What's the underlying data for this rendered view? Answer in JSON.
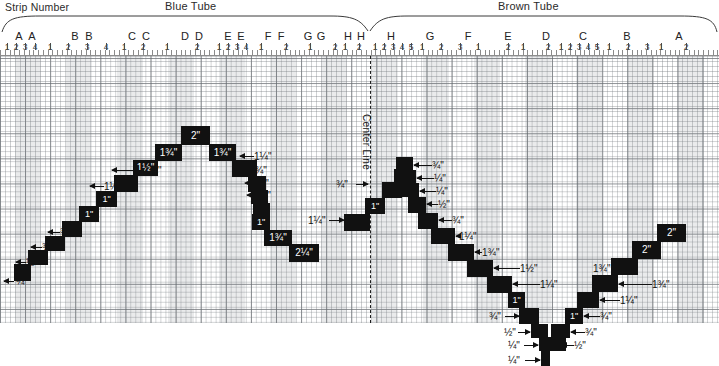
{
  "header": {
    "strip_number_label": "Strip Number",
    "blue_tube_label": "Blue Tube",
    "brown_tube_label": "Brown Tube",
    "center_line_label": "Center Line"
  },
  "ruler": {
    "letters": [
      {
        "label": "A",
        "x": 19
      },
      {
        "label": "A",
        "x": 32
      },
      {
        "label": "B",
        "x": 75
      },
      {
        "label": "B",
        "x": 89
      },
      {
        "label": "C",
        "x": 132
      },
      {
        "label": "C",
        "x": 146
      },
      {
        "label": "D",
        "x": 185
      },
      {
        "label": "D",
        "x": 199
      },
      {
        "label": "E",
        "x": 228
      },
      {
        "label": "E",
        "x": 241
      },
      {
        "label": "F",
        "x": 268
      },
      {
        "label": "F",
        "x": 281
      },
      {
        "label": "G",
        "x": 308
      },
      {
        "label": "G",
        "x": 321
      },
      {
        "label": "H",
        "x": 348
      },
      {
        "label": "H",
        "x": 361
      },
      {
        "label": "H",
        "x": 391
      },
      {
        "label": "G",
        "x": 430
      },
      {
        "label": "F",
        "x": 468
      },
      {
        "label": "E",
        "x": 508
      },
      {
        "label": "D",
        "x": 546
      },
      {
        "label": "C",
        "x": 583
      },
      {
        "label": "B",
        "x": 627
      },
      {
        "label": "A",
        "x": 679
      }
    ],
    "numbers": [
      {
        "label": "1",
        "x": 7
      },
      {
        "label": "2",
        "x": 16
      },
      {
        "label": "3",
        "x": 25
      },
      {
        "label": "4",
        "x": 35
      },
      {
        "label": "1",
        "x": 50
      },
      {
        "label": "2",
        "x": 68
      },
      {
        "label": "3",
        "x": 87
      },
      {
        "label": "4",
        "x": 106
      },
      {
        "label": "1",
        "x": 124
      },
      {
        "label": "2",
        "x": 143
      },
      {
        "label": "1",
        "x": 167
      },
      {
        "label": "2",
        "x": 197
      },
      {
        "label": "1",
        "x": 219
      },
      {
        "label": "2",
        "x": 228
      },
      {
        "label": "3",
        "x": 237
      },
      {
        "label": "4",
        "x": 246
      },
      {
        "label": "1",
        "x": 261
      },
      {
        "label": "2",
        "x": 286
      },
      {
        "label": "1",
        "x": 310
      },
      {
        "label": "2",
        "x": 335
      },
      {
        "label": "1",
        "x": 345
      },
      {
        "label": "2",
        "x": 359
      },
      {
        "label": "1",
        "x": 375
      },
      {
        "label": "2",
        "x": 384
      },
      {
        "label": "3",
        "x": 393
      },
      {
        "label": "4",
        "x": 402
      },
      {
        "label": "5",
        "x": 411
      },
      {
        "label": "1",
        "x": 422
      },
      {
        "label": "2",
        "x": 441
      },
      {
        "label": "3",
        "x": 460
      },
      {
        "label": "1",
        "x": 478
      },
      {
        "label": "2",
        "x": 508
      },
      {
        "label": "1",
        "x": 523
      },
      {
        "label": "2",
        "x": 548
      },
      {
        "label": "1",
        "x": 561
      },
      {
        "label": "2",
        "x": 570
      },
      {
        "label": "3",
        "x": 579
      },
      {
        "label": "4",
        "x": 588
      },
      {
        "label": "5",
        "x": 597
      },
      {
        "label": "1",
        "x": 609
      },
      {
        "label": "2",
        "x": 628
      },
      {
        "label": "3",
        "x": 647
      },
      {
        "label": "1",
        "x": 661
      },
      {
        "label": "2",
        "x": 686
      }
    ]
  },
  "shading_bands": [
    {
      "x": 15,
      "w": 26
    },
    {
      "x": 66,
      "w": 26
    },
    {
      "x": 117,
      "w": 26
    },
    {
      "x": 168,
      "w": 26
    },
    {
      "x": 219,
      "w": 26
    },
    {
      "x": 270,
      "w": 26
    },
    {
      "x": 321,
      "w": 26
    },
    {
      "x": 372,
      "w": 26
    },
    {
      "x": 423,
      "w": 26
    },
    {
      "x": 474,
      "w": 26
    },
    {
      "x": 525,
      "w": 26
    },
    {
      "x": 576,
      "w": 26
    },
    {
      "x": 627,
      "w": 26
    },
    {
      "x": 678,
      "w": 26
    }
  ],
  "blocks": [
    {
      "id": "b1",
      "x": 14,
      "y": 208,
      "w": 17,
      "h": 17,
      "label": ""
    },
    {
      "id": "b2",
      "x": 28,
      "y": 194,
      "w": 20,
      "h": 15,
      "label": ""
    },
    {
      "id": "b3",
      "x": 45,
      "y": 180,
      "w": 20,
      "h": 15,
      "label": ""
    },
    {
      "id": "b4",
      "x": 62,
      "y": 165,
      "w": 20,
      "h": 16,
      "label": ""
    },
    {
      "id": "b5",
      "x": 79,
      "y": 150,
      "w": 20,
      "h": 16,
      "label": "1\""
    },
    {
      "id": "b6",
      "x": 96,
      "y": 135,
      "w": 21,
      "h": 16,
      "label": "1\""
    },
    {
      "id": "b7",
      "x": 114,
      "y": 119,
      "w": 24,
      "h": 17,
      "label": ""
    },
    {
      "id": "b8",
      "x": 133,
      "y": 104,
      "w": 25,
      "h": 16,
      "label": "1½\""
    },
    {
      "id": "b9",
      "x": 155,
      "y": 88,
      "w": 27,
      "h": 17,
      "label": "1¾\""
    },
    {
      "id": "b10",
      "x": 181,
      "y": 70,
      "w": 29,
      "h": 19,
      "label": "2\""
    },
    {
      "id": "b11",
      "x": 209,
      "y": 88,
      "w": 27,
      "h": 17,
      "label": "1¾\""
    },
    {
      "id": "b12",
      "x": 232,
      "y": 104,
      "w": 25,
      "h": 17,
      "label": ""
    },
    {
      "id": "b13",
      "x": 248,
      "y": 120,
      "w": 18,
      "h": 16,
      "label": ""
    },
    {
      "id": "b14",
      "x": 251,
      "y": 134,
      "w": 17,
      "h": 14,
      "label": ""
    },
    {
      "id": "b15",
      "x": 253,
      "y": 147,
      "w": 17,
      "h": 14,
      "label": ""
    },
    {
      "id": "b16",
      "x": 252,
      "y": 158,
      "w": 18,
      "h": 16,
      "label": "1\""
    },
    {
      "id": "b17",
      "x": 264,
      "y": 174,
      "w": 28,
      "h": 16,
      "label": "1¾\""
    },
    {
      "id": "b18",
      "x": 289,
      "y": 188,
      "w": 30,
      "h": 18,
      "label": "2¼\""
    },
    {
      "id": "b19",
      "x": 344,
      "y": 158,
      "w": 26,
      "h": 17,
      "label": ""
    },
    {
      "id": "b20",
      "x": 365,
      "y": 142,
      "w": 20,
      "h": 16,
      "label": "1\""
    },
    {
      "id": "b21",
      "x": 382,
      "y": 126,
      "w": 20,
      "h": 16,
      "label": ""
    },
    {
      "id": "b22",
      "x": 394,
      "y": 113,
      "w": 17,
      "h": 14,
      "label": ""
    },
    {
      "id": "b23",
      "x": 396,
      "y": 101,
      "w": 17,
      "h": 14,
      "label": ""
    },
    {
      "id": "b24",
      "x": 399,
      "y": 114,
      "w": 17,
      "h": 14,
      "label": ""
    },
    {
      "id": "b25",
      "x": 402,
      "y": 127,
      "w": 17,
      "h": 14,
      "label": ""
    },
    {
      "id": "b26",
      "x": 408,
      "y": 141,
      "w": 18,
      "h": 16,
      "label": ""
    },
    {
      "id": "b27",
      "x": 418,
      "y": 157,
      "w": 20,
      "h": 16,
      "label": ""
    },
    {
      "id": "b28",
      "x": 431,
      "y": 172,
      "w": 24,
      "h": 16,
      "label": ""
    },
    {
      "id": "b29",
      "x": 448,
      "y": 188,
      "w": 26,
      "h": 17,
      "label": ""
    },
    {
      "id": "b30",
      "x": 467,
      "y": 204,
      "w": 26,
      "h": 17,
      "label": ""
    },
    {
      "id": "b31",
      "x": 487,
      "y": 220,
      "w": 25,
      "h": 17,
      "label": ""
    },
    {
      "id": "b32",
      "x": 508,
      "y": 236,
      "w": 17,
      "h": 16,
      "label": "1\""
    },
    {
      "id": "b33",
      "x": 519,
      "y": 252,
      "w": 20,
      "h": 16,
      "label": ""
    },
    {
      "id": "b34",
      "x": 531,
      "y": 268,
      "w": 17,
      "h": 14,
      "label": ""
    },
    {
      "id": "b35",
      "x": 539,
      "y": 281,
      "w": 12,
      "h": 14,
      "label": ""
    },
    {
      "id": "b36",
      "x": 541,
      "y": 294,
      "w": 9,
      "h": 16,
      "label": ""
    },
    {
      "id": "b37",
      "x": 549,
      "y": 281,
      "w": 17,
      "h": 14,
      "label": ""
    },
    {
      "id": "b38",
      "x": 551,
      "y": 268,
      "w": 19,
      "h": 14,
      "label": ""
    },
    {
      "id": "b39",
      "x": 565,
      "y": 252,
      "w": 18,
      "h": 16,
      "label": "1\""
    },
    {
      "id": "b40",
      "x": 577,
      "y": 236,
      "w": 22,
      "h": 16,
      "label": ""
    },
    {
      "id": "b41",
      "x": 592,
      "y": 219,
      "w": 26,
      "h": 17,
      "label": ""
    },
    {
      "id": "b42",
      "x": 611,
      "y": 202,
      "w": 27,
      "h": 17,
      "label": ""
    },
    {
      "id": "b43",
      "x": 632,
      "y": 185,
      "w": 29,
      "h": 18,
      "label": "2\""
    },
    {
      "id": "b44",
      "x": 657,
      "y": 168,
      "w": 29,
      "h": 18,
      "label": "2\""
    }
  ],
  "callouts": [
    {
      "id": "c1",
      "text": "¼\"",
      "tx": 16,
      "ty": 221,
      "ax": 4,
      "ay": 225,
      "aw": 10,
      "dir": "l"
    },
    {
      "id": "c2",
      "text": "½\"",
      "tx": 26,
      "ty": 202,
      "ax": 16,
      "ay": 206,
      "aw": 10,
      "dir": "l"
    },
    {
      "id": "c3",
      "text": "¾\"",
      "tx": 42,
      "ty": 187,
      "ax": 31,
      "ay": 191,
      "aw": 11,
      "dir": "l"
    },
    {
      "id": "c4",
      "text": "¾\"",
      "tx": 60,
      "ty": 172,
      "ax": 48,
      "ay": 176,
      "aw": 12,
      "dir": "l"
    },
    {
      "id": "c5",
      "text": "1¼\"",
      "tx": 104,
      "ty": 126,
      "ax": 90,
      "ay": 130,
      "aw": 14,
      "dir": "l"
    },
    {
      "id": "c6",
      "text": "1¼\"",
      "tx": 144,
      "ty": 110,
      "ax": 112,
      "ay": 114,
      "aw": 32,
      "dir": "l"
    },
    {
      "id": "c7",
      "text": "1¼\"",
      "tx": 254,
      "ty": 96,
      "ax": 240,
      "ay": 100,
      "aw": 14,
      "dir": "l"
    },
    {
      "id": "c8",
      "text": "¾\"",
      "tx": 255,
      "ty": 110,
      "ax": 243,
      "ay": 114,
      "aw": 12,
      "dir": "l"
    },
    {
      "id": "c9",
      "text": "¼\"",
      "tx": 257,
      "ty": 123,
      "ax": 245,
      "ay": 127,
      "aw": 12,
      "dir": "l"
    },
    {
      "id": "c10",
      "text": "¼\"",
      "tx": 259,
      "ty": 135,
      "ax": 247,
      "ay": 139,
      "aw": 12,
      "dir": "l"
    },
    {
      "id": "c11",
      "text": "1¼\"",
      "tx": 308,
      "ty": 160,
      "ax": 329,
      "ay": 164,
      "aw": 15,
      "dir": "r"
    },
    {
      "id": "c12",
      "text": "¾\"",
      "tx": 336,
      "ty": 124,
      "ax": 356,
      "ay": 128,
      "aw": 12,
      "dir": "r"
    },
    {
      "id": "c13",
      "text": "¾\"",
      "tx": 432,
      "ty": 105,
      "ax": 414,
      "ay": 109,
      "aw": 18,
      "dir": "l"
    },
    {
      "id": "c14",
      "text": "¼\"",
      "tx": 434,
      "ty": 118,
      "ax": 417,
      "ay": 122,
      "aw": 17,
      "dir": "l"
    },
    {
      "id": "c15",
      "text": "¼\"",
      "tx": 436,
      "ty": 131,
      "ax": 420,
      "ay": 135,
      "aw": 16,
      "dir": "l"
    },
    {
      "id": "c16",
      "text": "½\"",
      "tx": 438,
      "ty": 144,
      "ax": 427,
      "ay": 148,
      "aw": 11,
      "dir": "l"
    },
    {
      "id": "c17",
      "text": "¾\"",
      "tx": 452,
      "ty": 160,
      "ax": 439,
      "ay": 164,
      "aw": 13,
      "dir": "l"
    },
    {
      "id": "c18",
      "text": "1¼\"",
      "tx": 459,
      "ty": 176,
      "ax": 456,
      "ay": 180,
      "aw": 3,
      "dir": "l"
    },
    {
      "id": "c19",
      "text": "1¾\"",
      "tx": 482,
      "ty": 192,
      "ax": 475,
      "ay": 196,
      "aw": 7,
      "dir": "l"
    },
    {
      "id": "c20",
      "text": "1½\"",
      "tx": 520,
      "ty": 208,
      "ax": 494,
      "ay": 212,
      "aw": 26,
      "dir": "l"
    },
    {
      "id": "c21",
      "text": "1¼\"",
      "tx": 540,
      "ty": 224,
      "ax": 513,
      "ay": 228,
      "aw": 27,
      "dir": "l"
    },
    {
      "id": "c22",
      "text": "¾\"",
      "tx": 489,
      "ty": 256,
      "ax": 505,
      "ay": 260,
      "aw": 14,
      "dir": "r"
    },
    {
      "id": "c23",
      "text": "½\"",
      "tx": 504,
      "ty": 272,
      "ax": 518,
      "ay": 276,
      "aw": 12,
      "dir": "r"
    },
    {
      "id": "c24",
      "text": "¼\"",
      "tx": 508,
      "ty": 285,
      "ax": 524,
      "ay": 289,
      "aw": 14,
      "dir": "r"
    },
    {
      "id": "c25",
      "text": "¼\"",
      "tx": 508,
      "ty": 300,
      "ax": 525,
      "ay": 304,
      "aw": 15,
      "dir": "r"
    },
    {
      "id": "c26",
      "text": "½\"",
      "tx": 574,
      "ty": 285,
      "ax": 562,
      "ay": 289,
      "aw": 12,
      "dir": "l"
    },
    {
      "id": "c27",
      "text": "¾\"",
      "tx": 585,
      "ty": 272,
      "ax": 571,
      "ay": 276,
      "aw": 14,
      "dir": "l"
    },
    {
      "id": "c28",
      "text": "¾\"",
      "tx": 600,
      "ty": 256,
      "ax": 584,
      "ay": 260,
      "aw": 16,
      "dir": "l"
    },
    {
      "id": "c29",
      "text": "1¼\"",
      "tx": 620,
      "ty": 240,
      "ax": 600,
      "ay": 244,
      "aw": 20,
      "dir": "l"
    },
    {
      "id": "c30",
      "text": "1¾\"",
      "tx": 652,
      "ty": 224,
      "ax": 619,
      "ay": 228,
      "aw": 33,
      "dir": "l"
    },
    {
      "id": "c31",
      "text": "1¾\"",
      "tx": 593,
      "ty": 208,
      "ax": 619,
      "ay": 212,
      "aw": 14,
      "dir": "r"
    }
  ]
}
